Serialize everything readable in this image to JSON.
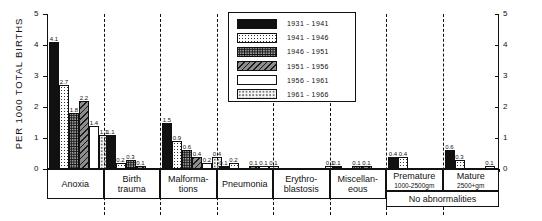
{
  "chart_data": {
    "type": "bar",
    "title": "",
    "ylabel": "PER 1000 TOTAL BIRTHS",
    "xlabel": "",
    "ylim": [
      0,
      5
    ],
    "yticks": [
      "0",
      "1",
      "2",
      "3",
      "4",
      "5"
    ],
    "grid": false,
    "legend_position": "top-center",
    "categories": [
      "Anoxia",
      "Birth trauma",
      "Malformations",
      "Pneumonia",
      "Erythroblastosis",
      "Miscellaneous",
      "Premature 1000-2500gm",
      "Mature 2500+gm"
    ],
    "category_lines": [
      [
        "Anoxia"
      ],
      [
        "Birth",
        "trauma"
      ],
      [
        "Malforma-",
        "tions"
      ],
      [
        "Pneumonia"
      ],
      [
        "Erythro-",
        "blastosis"
      ],
      [
        "Miscellan-",
        "eous"
      ],
      [
        "Premature",
        "1000-2500gm"
      ],
      [
        "Mature",
        "2500+gm"
      ]
    ],
    "span_label": "No abnormalities",
    "series": [
      {
        "name": "1931 - 1941",
        "pattern": "solid-black",
        "values": [
          4.1,
          1.1,
          1.5,
          0.1,
          0.0,
          0.1,
          0.4,
          0.6
        ]
      },
      {
        "name": "1941 - 1946",
        "pattern": "fine-dotted",
        "values": [
          2.7,
          0.2,
          0.9,
          0.2,
          0.0,
          0.0,
          0.4,
          0.3
        ]
      },
      {
        "name": "1946 - 1951",
        "pattern": "dense-stipple",
        "values": [
          1.8,
          0.3,
          0.6,
          0.0,
          0.0,
          0.1,
          0.0,
          0.0
        ]
      },
      {
        "name": "1951 - 1956",
        "pattern": "diagonal-hatch",
        "values": [
          2.2,
          0.1,
          0.4,
          0.1,
          0.0,
          0.1,
          0.0,
          0.0
        ]
      },
      {
        "name": "1956 - 1961",
        "pattern": "open-white",
        "values": [
          1.4,
          0.0,
          0.2,
          0.1,
          0.0,
          0.0,
          0.0,
          0.1
        ]
      },
      {
        "name": "1961 - 1966",
        "pattern": "light-stipple",
        "values": [
          1.1,
          0.0,
          0.4,
          0.1,
          0.1,
          0.0,
          0.0,
          0.0
        ]
      }
    ],
    "bar_labels": {
      "Anoxia": [
        "4.1",
        "2.7",
        "1.8",
        "2.2",
        "1.4",
        "1.1"
      ],
      "Birth trauma": [
        "1.1",
        "0.2",
        "0.3",
        "0.1",
        "",
        ""
      ],
      "Malformations": [
        "1.5",
        "0.9",
        "0.6",
        "0.4",
        "0.2",
        "0.4"
      ],
      "Pneumonia": [
        "0.1",
        "0.2",
        "",
        "0.1",
        "0.1",
        "0.1"
      ],
      "Erythroblastosis": [
        "",
        "",
        "",
        "",
        "",
        "0.1"
      ],
      "Miscellaneous": [
        "0.1",
        "",
        "0.1",
        "0.1",
        "",
        ""
      ],
      "Premature 1000-2500gm": [
        "0.4",
        "0.4",
        "",
        "",
        "",
        ""
      ],
      "Mature 2500+gm": [
        "0.6",
        "0.3",
        "",
        "",
        "0.1",
        ""
      ]
    }
  },
  "legend": {
    "items": [
      "1931 - 1941",
      "1941 - 1946",
      "1946 - 1951",
      "1951 - 1956",
      "1956 - 1961",
      "1961 - 1966"
    ]
  },
  "axes": {
    "y_title": "PER 1000 TOTAL BIRTHS",
    "ticks": [
      "5",
      "4",
      "3",
      "2",
      "1",
      "0"
    ]
  }
}
